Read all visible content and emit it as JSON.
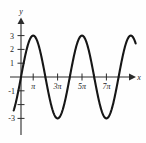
{
  "figure": {
    "caption_strip": "",
    "background_color": "#fefefe",
    "curve_color": "#161616",
    "axis_color": "#2b2b2b"
  },
  "axes": {
    "x_axis_label": "x",
    "y_axis_label": "y"
  },
  "chart_data": {
    "type": "line",
    "title": "",
    "subtitle": "",
    "xlabel": "x",
    "ylabel": "y",
    "xlim": [
      -0.6,
      9.4
    ],
    "ylim": [
      -3.6,
      3.6
    ],
    "grid": false,
    "legend": null,
    "x_tick_labels": [
      "π",
      "3π",
      "5π",
      "7π"
    ],
    "x_tick_values": [
      1,
      3,
      5,
      7
    ],
    "x_minor_tick_values": [
      2,
      4,
      6,
      8
    ],
    "y_tick_labels": [
      "3",
      "2",
      "1",
      "-1",
      "-3"
    ],
    "y_tick_values": [
      3,
      2,
      1,
      -1,
      -3
    ],
    "y_unlabeled_tick_values": [
      -2
    ],
    "series": [
      {
        "name": "y = 3 sin(xπ/2)",
        "amplitude": 3,
        "period_in_pi_units": 4,
        "equation": "y = 3 sin(πx/2)",
        "x": [
          -0.6,
          -0.4,
          -0.2,
          0,
          0.2,
          0.4,
          0.6,
          0.8,
          1,
          1.2,
          1.4,
          1.6,
          1.8,
          2,
          2.2,
          2.4,
          2.6,
          2.8,
          3,
          3.2,
          3.4,
          3.6,
          3.8,
          4,
          4.2,
          4.4,
          4.6,
          4.8,
          5,
          5.2,
          5.4,
          5.6,
          5.8,
          6,
          6.2,
          6.4,
          6.6,
          6.8,
          7,
          7.2,
          7.4,
          7.6,
          7.8,
          8,
          8.2,
          8.4,
          8.6,
          8.8,
          9,
          9.2
        ],
        "y": [
          -2.71,
          -1.85,
          -0.93,
          0,
          0.93,
          1.85,
          2.71,
          3.0,
          2.71,
          1.85,
          0.93,
          0,
          -0.93,
          -1.85,
          -2.71,
          -3.0,
          -2.71,
          -1.85,
          -0.93,
          0,
          0.93,
          1.85,
          2.71,
          3.0,
          2.71,
          1.85,
          0.93,
          0,
          -0.93,
          -1.85,
          -2.71,
          -3.0,
          -2.71,
          -1.85,
          -0.93,
          0,
          0.93,
          1.85,
          2.71,
          3.0,
          2.71,
          1.85,
          0.93,
          0,
          -0.93,
          -1.85,
          -2.71,
          -3.0,
          -2.71,
          -1.85
        ],
        "peaks_at_x": [
          0.8,
          4.0,
          7.2
        ],
        "troughs_at_x": [
          2.4,
          5.6,
          8.8
        ],
        "zero_crossings_at_x": [
          0,
          1.6,
          3.2,
          4.8,
          6.4,
          8.0
        ]
      }
    ]
  }
}
